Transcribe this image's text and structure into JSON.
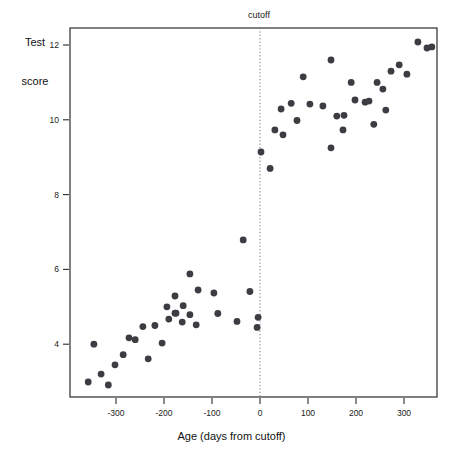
{
  "chart_data": {
    "type": "scatter",
    "title": "",
    "xlabel": "Age (days from cutoff)",
    "ylabel": "Test score",
    "ylabel_line1": "Test",
    "ylabel_line2": "score",
    "xlim": [
      -370,
      370
    ],
    "ylim": [
      2.5,
      12.6
    ],
    "xticks": [
      -300,
      -200,
      -100,
      0,
      100,
      200,
      300
    ],
    "xticklabels": [
      "-300",
      "-200",
      "-100",
      "0",
      "100",
      "200",
      "300"
    ],
    "yticks": [
      4,
      6,
      8,
      10,
      12
    ],
    "yticklabels": [
      "4",
      "6",
      "8",
      "10",
      "12"
    ],
    "grid": false,
    "legend": null,
    "annotations": [
      {
        "name": "cutoff",
        "label": "cutoff",
        "type": "vline",
        "x": 0,
        "style": "dotted"
      }
    ],
    "series": [
      {
        "name": "below cutoff",
        "color": "#3c3c42",
        "points": [
          {
            "x": -358,
            "y": 2.99
          },
          {
            "x": -331,
            "y": 3.2
          },
          {
            "x": -316,
            "y": 2.91
          },
          {
            "x": -346,
            "y": 4.0
          },
          {
            "x": -302,
            "y": 3.45
          },
          {
            "x": -285,
            "y": 3.72
          },
          {
            "x": -273,
            "y": 4.17
          },
          {
            "x": -260,
            "y": 4.12
          },
          {
            "x": -244,
            "y": 4.47
          },
          {
            "x": -233,
            "y": 3.61
          },
          {
            "x": -219,
            "y": 4.5
          },
          {
            "x": -204,
            "y": 4.03
          },
          {
            "x": -190,
            "y": 4.67
          },
          {
            "x": -175,
            "y": 4.83
          },
          {
            "x": -162,
            "y": 4.59
          },
          {
            "x": -146,
            "y": 5.88
          },
          {
            "x": -129,
            "y": 5.45
          },
          {
            "x": -96,
            "y": 5.37
          },
          {
            "x": -177,
            "y": 5.29
          },
          {
            "x": -177,
            "y": 4.83
          },
          {
            "x": -194,
            "y": 5.0
          },
          {
            "x": -160,
            "y": 5.03
          },
          {
            "x": -146,
            "y": 4.79
          },
          {
            "x": -88,
            "y": 4.82
          },
          {
            "x": -133,
            "y": 4.52
          },
          {
            "x": -48,
            "y": 4.61
          },
          {
            "x": -4,
            "y": 4.72
          },
          {
            "x": -35,
            "y": 6.79
          },
          {
            "x": -21,
            "y": 5.41
          },
          {
            "x": -6,
            "y": 4.45
          }
        ]
      },
      {
        "name": "above cutoff",
        "color": "#3c3c42",
        "points": [
          {
            "x": 2,
            "y": 9.14
          },
          {
            "x": 21,
            "y": 8.7
          },
          {
            "x": 31,
            "y": 9.73
          },
          {
            "x": 48,
            "y": 9.6
          },
          {
            "x": 44,
            "y": 10.29
          },
          {
            "x": 65,
            "y": 10.44
          },
          {
            "x": 77,
            "y": 9.98
          },
          {
            "x": 104,
            "y": 10.42
          },
          {
            "x": 90,
            "y": 11.15
          },
          {
            "x": 131,
            "y": 10.37
          },
          {
            "x": 148,
            "y": 11.6
          },
          {
            "x": 160,
            "y": 10.1
          },
          {
            "x": 173,
            "y": 9.73
          },
          {
            "x": 148,
            "y": 9.25
          },
          {
            "x": 190,
            "y": 11.0
          },
          {
            "x": 198,
            "y": 10.53
          },
          {
            "x": 219,
            "y": 10.47
          },
          {
            "x": 227,
            "y": 10.5
          },
          {
            "x": 244,
            "y": 11.0
          },
          {
            "x": 256,
            "y": 10.82
          },
          {
            "x": 237,
            "y": 9.88
          },
          {
            "x": 262,
            "y": 10.26
          },
          {
            "x": 273,
            "y": 11.3
          },
          {
            "x": 290,
            "y": 11.47
          },
          {
            "x": 329,
            "y": 12.08
          },
          {
            "x": 348,
            "y": 11.92
          },
          {
            "x": 358,
            "y": 11.95
          },
          {
            "x": 175,
            "y": 10.12
          },
          {
            "x": 306,
            "y": 11.22
          }
        ]
      }
    ]
  },
  "figure": {
    "plot_area": {
      "left": 70,
      "top": 28,
      "right": 437,
      "bottom": 397
    },
    "dot_radius": 3.4,
    "frame_color": "#2b2b2b",
    "dot_color": "#3c3c42",
    "cutoff_color": "#777777",
    "background": "#ffffff"
  }
}
